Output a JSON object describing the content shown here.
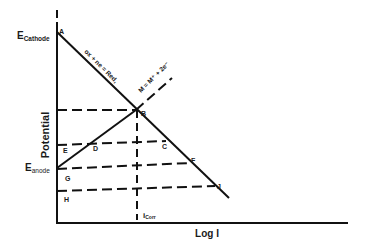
{
  "diagram": {
    "axes": {
      "y_label": "Potential",
      "x_label": "Log I"
    },
    "potential_labels": {
      "cathode": {
        "main": "E",
        "sub": "Cathode"
      },
      "anode": {
        "main": "E",
        "sub": "anode"
      }
    },
    "current_label": {
      "main": "i",
      "sub": "Corr"
    },
    "reactions": {
      "cathodic": "ox + ne = Red,",
      "anodic": "M = M⁺ + 2e⁻"
    },
    "points": {
      "A": "A",
      "B": "B",
      "C": "C",
      "D": "D",
      "E": "E",
      "F": "F",
      "G": "G",
      "H": "H",
      "J": "J"
    },
    "colors": {
      "line": "#111111",
      "background": "#ffffff"
    }
  }
}
